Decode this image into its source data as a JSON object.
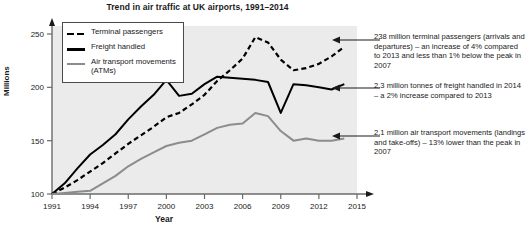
{
  "title": "Trend in air traffic at UK airports, 1991–2014",
  "axes": {
    "ylabel": "Millions",
    "xlabel": "Year",
    "yticks": [
      100,
      150,
      200,
      250
    ],
    "xticks": [
      1991,
      1994,
      1997,
      2000,
      2003,
      2006,
      2009,
      2012,
      2015
    ]
  },
  "legend": {
    "items": [
      {
        "label": "Terminal passengers",
        "style": "dashed",
        "color": "#000000"
      },
      {
        "label": "Freight handled",
        "style": "solid",
        "color": "#000000"
      },
      {
        "label": "Air transport movements (ATMs)",
        "style": "solid",
        "color": "#8c8c8c"
      }
    ]
  },
  "annotations": [
    {
      "text": "238 million terminal passengers (arrivals and departures) – an increase of 4% compared to 2013 and less than 1% below the peak in 2007"
    },
    {
      "text": "2.3 million tonnes of freight handled in 2014 – a 2% increase compared to 2013"
    },
    {
      "text": "2.1 million air transport movements (landings and take-offs) – 13% lower than the peak in 2007"
    }
  ],
  "chart_data": {
    "type": "line",
    "title": "Trend in air traffic at UK airports, 1991–2014",
    "xlabel": "Year",
    "ylabel": "Millions",
    "xlim": [
      1991,
      2015
    ],
    "ylim": [
      100,
      258
    ],
    "grid": false,
    "legend_position": "top-left",
    "x": [
      1991,
      1992,
      1993,
      1994,
      1995,
      1996,
      1997,
      1998,
      1999,
      2000,
      2001,
      2002,
      2003,
      2004,
      2005,
      2006,
      2007,
      2008,
      2009,
      2010,
      2011,
      2012,
      2013,
      2014
    ],
    "series": [
      {
        "name": "Terminal passengers",
        "color": "#000000",
        "style": "dashed",
        "values": [
          100,
          106,
          113,
          121,
          129,
          138,
          147,
          155,
          163,
          172,
          176,
          184,
          193,
          206,
          216,
          227,
          247,
          242,
          226,
          216,
          218,
          222,
          229,
          238
        ]
      },
      {
        "name": "Freight handled",
        "color": "#000000",
        "style": "solid",
        "values": [
          100,
          110,
          124,
          137,
          146,
          156,
          170,
          182,
          193,
          207,
          192,
          194,
          203,
          210,
          209,
          208,
          207,
          205,
          176,
          203,
          202,
          200,
          198,
          203
        ]
      },
      {
        "name": "Air transport movements (ATMs)",
        "color": "#8c8c8c",
        "style": "solid",
        "values": [
          100,
          101,
          102,
          103,
          110,
          117,
          126,
          133,
          139,
          145,
          148,
          150,
          156,
          162,
          165,
          166,
          176,
          173,
          159,
          150,
          152,
          150,
          150,
          152
        ]
      }
    ]
  }
}
